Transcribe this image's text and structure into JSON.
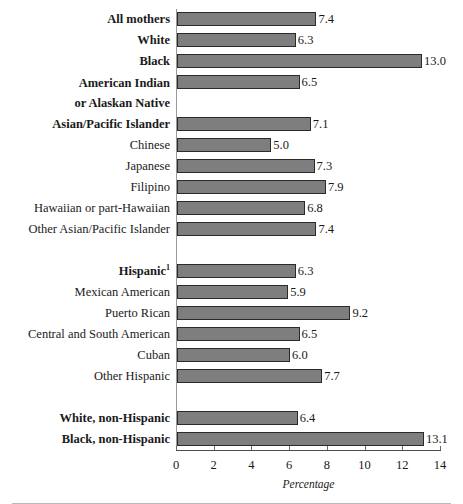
{
  "chart_data": {
    "type": "bar",
    "orientation": "horizontal",
    "title": "",
    "xlabel": "Percentage",
    "ylabel": "",
    "xlim": [
      0,
      14
    ],
    "xticks": [
      0,
      2,
      4,
      6,
      8,
      10,
      12,
      14
    ],
    "xtick_labels": [
      "0",
      "2",
      "4",
      "6",
      "8",
      "10",
      "12",
      "14"
    ],
    "grid": false,
    "legend": false,
    "bar_color": "#7e7e7e",
    "bar_border_color": "#2a2a2a",
    "footnote_marker": "1",
    "categories": [
      "All mothers",
      "White",
      "Black",
      "American Indian or Alaskan Native",
      "Asian/Pacific Islander",
      "Chinese",
      "Japanese",
      "Filipino",
      "Hawaiian or part-Hawaiian",
      "Other Asian/Pacific Islander",
      "Hispanic",
      "Mexican American",
      "Puerto Rican",
      "Central and South American",
      "Cuban",
      "Other Hispanic",
      "White, non-Hispanic",
      "Black, non-Hispanic"
    ],
    "values": [
      7.4,
      6.3,
      13.0,
      6.5,
      7.1,
      5.0,
      7.3,
      7.9,
      6.8,
      7.4,
      6.3,
      5.9,
      9.2,
      6.5,
      6.0,
      7.7,
      6.4,
      13.1
    ]
  },
  "rows": [
    {
      "label": "All mothers",
      "label_line2": "",
      "value": 7.4,
      "value_text": "7.4",
      "bold": true,
      "superscript": "",
      "spacer_after": false
    },
    {
      "label": "White",
      "label_line2": "",
      "value": 6.3,
      "value_text": "6.3",
      "bold": true,
      "superscript": "",
      "spacer_after": false
    },
    {
      "label": "Black",
      "label_line2": "",
      "value": 13.0,
      "value_text": "13.0",
      "bold": true,
      "superscript": "",
      "spacer_after": false
    },
    {
      "label": "American Indian",
      "label_line2": "or Alaskan Native",
      "value": 6.5,
      "value_text": "6.5",
      "bold": true,
      "superscript": "",
      "spacer_after": false
    },
    {
      "label": "Asian/Pacific Islander",
      "label_line2": "",
      "value": 7.1,
      "value_text": "7.1",
      "bold": true,
      "superscript": "",
      "spacer_after": false
    },
    {
      "label": "Chinese",
      "label_line2": "",
      "value": 5.0,
      "value_text": "5.0",
      "bold": false,
      "superscript": "",
      "spacer_after": false
    },
    {
      "label": "Japanese",
      "label_line2": "",
      "value": 7.3,
      "value_text": "7.3",
      "bold": false,
      "superscript": "",
      "spacer_after": false
    },
    {
      "label": "Filipino",
      "label_line2": "",
      "value": 7.9,
      "value_text": "7.9",
      "bold": false,
      "superscript": "",
      "spacer_after": false
    },
    {
      "label": "Hawaiian or part-Hawaiian",
      "label_line2": "",
      "value": 6.8,
      "value_text": "6.8",
      "bold": false,
      "superscript": "",
      "spacer_after": false
    },
    {
      "label": "Other Asian/Pacific Islander",
      "label_line2": "",
      "value": 7.4,
      "value_text": "7.4",
      "bold": false,
      "superscript": "",
      "spacer_after": true
    },
    {
      "label": "Hispanic",
      "label_line2": "",
      "value": 6.3,
      "value_text": "6.3",
      "bold": true,
      "superscript": "1",
      "spacer_after": false
    },
    {
      "label": "Mexican American",
      "label_line2": "",
      "value": 5.9,
      "value_text": "5.9",
      "bold": false,
      "superscript": "",
      "spacer_after": false
    },
    {
      "label": "Puerto Rican",
      "label_line2": "",
      "value": 9.2,
      "value_text": "9.2",
      "bold": false,
      "superscript": "",
      "spacer_after": false
    },
    {
      "label": "Central and South American",
      "label_line2": "",
      "value": 6.5,
      "value_text": "6.5",
      "bold": false,
      "superscript": "",
      "spacer_after": false
    },
    {
      "label": "Cuban",
      "label_line2": "",
      "value": 6.0,
      "value_text": "6.0",
      "bold": false,
      "superscript": "",
      "spacer_after": false
    },
    {
      "label": "Other Hispanic",
      "label_line2": "",
      "value": 7.7,
      "value_text": "7.7",
      "bold": false,
      "superscript": "",
      "spacer_after": true
    },
    {
      "label": "White, non-Hispanic",
      "label_line2": "",
      "value": 6.4,
      "value_text": "6.4",
      "bold": true,
      "superscript": "",
      "spacer_after": false
    },
    {
      "label": "Black, non-Hispanic",
      "label_line2": "",
      "value": 13.1,
      "value_text": "13.1",
      "bold": true,
      "superscript": "",
      "spacer_after": false
    }
  ],
  "axis": {
    "label": "Percentage"
  }
}
